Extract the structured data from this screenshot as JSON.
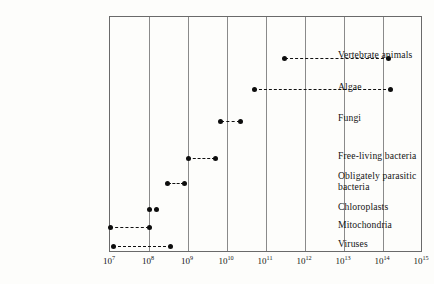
{
  "chart_data": {
    "type": "range",
    "title": "",
    "xlabel": "",
    "ylabel": "",
    "x_scale": "log10",
    "xlim": [
      10000000.0,
      1000000000000000.0
    ],
    "grid": true,
    "legend": "none",
    "axis": {
      "ticks": [
        {
          "label": "10",
          "exp": "7",
          "value": 10000000.0
        },
        {
          "label": "10",
          "exp": "8",
          "value": 100000000.0
        },
        {
          "label": "10",
          "exp": "9",
          "value": 1000000000.0
        },
        {
          "label": "10",
          "exp": "10",
          "value": 10000000000.0
        },
        {
          "label": "10",
          "exp": "11",
          "value": 100000000000.0
        },
        {
          "label": "10",
          "exp": "12",
          "value": 1000000000000.0
        },
        {
          "label": "10",
          "exp": "13",
          "value": 10000000000000.0
        },
        {
          "label": "10",
          "exp": "14",
          "value": 100000000000000.0
        },
        {
          "label": "10",
          "exp": "15",
          "value": 1000000000000000.0
        }
      ]
    },
    "categories": [
      "Vertebrate animals",
      "Algae",
      "Fungi",
      "Free-living bacteria",
      "Obligately parasitic\nbacteria",
      "Chloroplasts",
      "Mitochondria",
      "Viruses"
    ],
    "ranges": [
      {
        "name": "Vertebrate animals",
        "min": 300000000000.0,
        "max": 140000000000000.0
      },
      {
        "name": "Algae",
        "min": 50000000000.0,
        "max": 160000000000000.0
      },
      {
        "name": "Fungi",
        "min": 7000000000.0,
        "max": 22000000000.0
      },
      {
        "name": "Free-living bacteria",
        "min": 1000000000.0,
        "max": 5000000000.0
      },
      {
        "name": "Obligately parasitic bacteria",
        "min": 300000000.0,
        "max": 800000000.0
      },
      {
        "name": "Chloroplasts",
        "min": 100000000.0,
        "max": 160000000.0
      },
      {
        "name": "Mitochondria",
        "min": 10000000.0,
        "max": 100000000.0
      },
      {
        "name": "Viruses",
        "min": 12000000.0,
        "max": 360000000.0
      }
    ]
  },
  "rows": [
    {
      "label": "Vertebrate animals",
      "label_top": 50,
      "row_y": 57,
      "x_start": 109,
      "x_end": 283
    },
    {
      "label": "Algae",
      "label_top": 82,
      "row_y": 88,
      "x_start": 109,
      "x_end": 258
    },
    {
      "label": "Fungi",
      "label_top": 113,
      "row_y": 120,
      "x_start": 109,
      "x_end": 220
    },
    {
      "label": "Free-living bacteria",
      "label_top": 151,
      "row_y": 157,
      "x_start": 109,
      "x_end": 187
    },
    {
      "label": "Obligately parasitic\nbacteria",
      "label_top": 171,
      "row_y": 182,
      "x_start": 109,
      "x_end": 165
    },
    {
      "label": "Chloroplasts",
      "label_top": 202,
      "row_y": 208,
      "x_start": 109,
      "x_end": 148
    },
    {
      "label": "Mitochondria",
      "label_top": 220,
      "row_y": 226,
      "x_start": 109,
      "x_end": 109
    },
    {
      "label": "Viruses",
      "label_top": 239,
      "row_y": 245,
      "x_start": 109,
      "x_end": 112
    }
  ],
  "colors": {
    "frame": "#6a6a6a",
    "grid": "#8a8a8a",
    "marker": "#0d0d0d",
    "text": "#141414",
    "background": "#fdfdfb"
  }
}
